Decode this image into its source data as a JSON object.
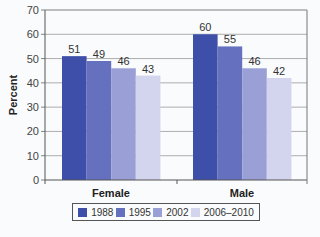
{
  "chart_data": {
    "type": "bar",
    "title": "",
    "xlabel": "",
    "ylabel": "Percent",
    "ylim": [
      0,
      70
    ],
    "yticks": [
      0,
      10,
      20,
      30,
      40,
      50,
      60,
      70
    ],
    "grid": true,
    "legend_position": "bottom",
    "categories": [
      "Female",
      "Male"
    ],
    "series": [
      {
        "name": "1988",
        "color": "#3d4fa8",
        "values": [
          51,
          60
        ]
      },
      {
        "name": "1995",
        "color": "#6570bf",
        "values": [
          49,
          55
        ]
      },
      {
        "name": "2002",
        "color": "#9aa0d6",
        "values": [
          46,
          46
        ]
      },
      {
        "name": "2006–2010",
        "color": "#d3d5ee",
        "values": [
          43,
          42
        ]
      }
    ],
    "data_labels": true
  }
}
